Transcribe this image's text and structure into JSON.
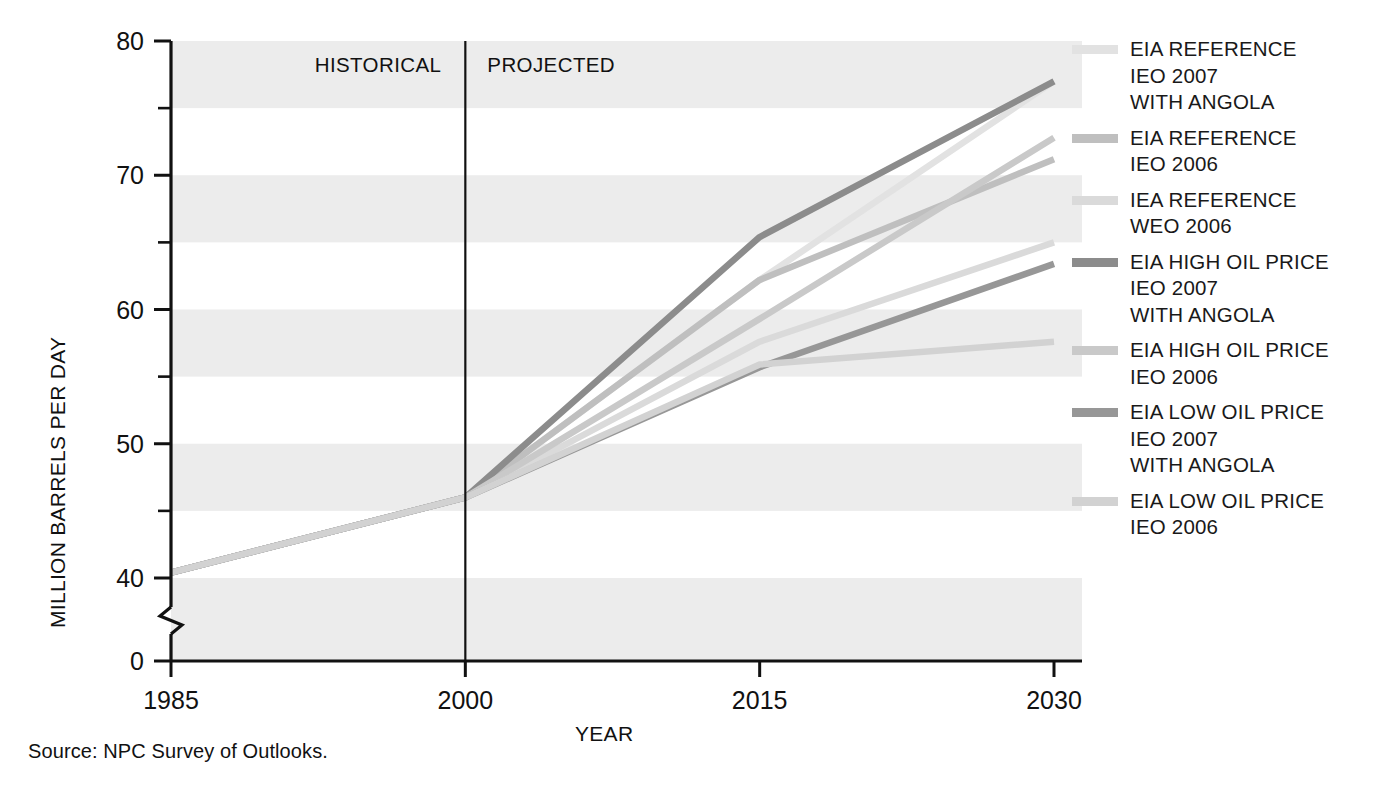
{
  "chart_data": {
    "type": "line",
    "title": "",
    "xlabel": "YEAR",
    "ylabel": "MILLION BARRELS PER DAY",
    "xlim": [
      1985,
      2030
    ],
    "ylim": [
      40,
      80
    ],
    "y_axis_break": true,
    "y_axis_break_note": "axis broken between 0 and 40",
    "yticks_major": [
      40,
      50,
      60,
      70,
      80
    ],
    "yticks_minor": [
      45,
      55,
      65,
      75
    ],
    "ytick_zero": "0",
    "xticks": [
      1985,
      2000,
      2015,
      2030
    ],
    "grid": false,
    "banding": "alternating light gray horizontal bands every 5 units starting at 80",
    "band_color": "#ececec",
    "divider_year": 2000,
    "region_labels": {
      "historical": "HISTORICAL",
      "projected": "PROJECTED"
    },
    "legend_position": "right",
    "series": [
      {
        "name": "EIA REFERENCE\nIEO 2007\nWITH ANGOLA",
        "color": "#e2e2e2",
        "x": [
          1985,
          2000,
          2015,
          2030
        ],
        "y": [
          40.4,
          46.0,
          62.2,
          77.0
        ]
      },
      {
        "name": "EIA REFERENCE\nIEO 2006",
        "color": "#bfbfbf",
        "x": [
          1985,
          2000,
          2015,
          2030
        ],
        "y": [
          40.4,
          46.0,
          62.2,
          71.2
        ]
      },
      {
        "name": "IEA REFERENCE\nWEO 2006",
        "color": "#dadada",
        "x": [
          1985,
          2000,
          2015,
          2030
        ],
        "y": [
          40.4,
          46.0,
          57.6,
          65.0
        ]
      },
      {
        "name": "EIA HIGH OIL PRICE\nIEO 2007\nWITH ANGOLA",
        "color": "#8c8c8c",
        "x": [
          1985,
          2000,
          2015,
          2030
        ],
        "y": [
          40.4,
          46.0,
          65.4,
          77.0
        ]
      },
      {
        "name": "EIA HIGH OIL PRICE\nIEO 2006",
        "color": "#c9c9c9",
        "x": [
          1985,
          2000,
          2015,
          2030
        ],
        "y": [
          40.4,
          46.0,
          59.3,
          72.8
        ]
      },
      {
        "name": "EIA LOW OIL PRICE\nIEO 2007\nWITH ANGOLA",
        "color": "#979797",
        "x": [
          1985,
          2000,
          2015,
          2030
        ],
        "y": [
          40.4,
          46.0,
          55.7,
          63.4
        ]
      },
      {
        "name": "EIA LOW OIL PRICE\nIEO 2006",
        "color": "#d2d2d2",
        "x": [
          1985,
          2000,
          2015,
          2030
        ],
        "y": [
          40.4,
          46.0,
          55.9,
          57.6
        ]
      }
    ]
  },
  "axis": {
    "y_title": "MILLION BARRELS PER DAY",
    "x_title": "YEAR",
    "ytick_80": "80",
    "ytick_70": "70",
    "ytick_60": "60",
    "ytick_50": "50",
    "ytick_40": "40",
    "ytick_0": "0",
    "xtick_1985": "1985",
    "xtick_2000": "2000",
    "xtick_2015": "2015",
    "xtick_2030": "2030"
  },
  "annotations": {
    "historical": "HISTORICAL",
    "projected": "PROJECTED"
  },
  "legend": {
    "items": [
      {
        "label": "EIA REFERENCE\nIEO 2007\nWITH ANGOLA",
        "color": "#e2e2e2"
      },
      {
        "label": "EIA REFERENCE\nIEO 2006",
        "color": "#bfbfbf"
      },
      {
        "label": "IEA REFERENCE\nWEO 2006",
        "color": "#dadada"
      },
      {
        "label": "EIA HIGH OIL PRICE\nIEO 2007\nWITH ANGOLA",
        "color": "#8c8c8c"
      },
      {
        "label": "EIA HIGH OIL PRICE\nIEO 2006",
        "color": "#c9c9c9"
      },
      {
        "label": "EIA LOW OIL PRICE\nIEO 2007\nWITH ANGOLA",
        "color": "#979797"
      },
      {
        "label": "EIA LOW OIL PRICE\nIEO 2006",
        "color": "#d2d2d2"
      }
    ]
  },
  "source": {
    "text": "Source:  NPC Survey of Outlooks."
  }
}
